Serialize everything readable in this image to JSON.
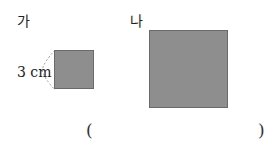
{
  "figures": {
    "a": {
      "label": "가",
      "dimension": "3 cm"
    },
    "b": {
      "label": "나"
    }
  },
  "answer": {
    "open": "(",
    "close": ")",
    "value": ""
  },
  "colors": {
    "square_fill": "#8e8e8e",
    "square_border": "#6a6a6a"
  }
}
